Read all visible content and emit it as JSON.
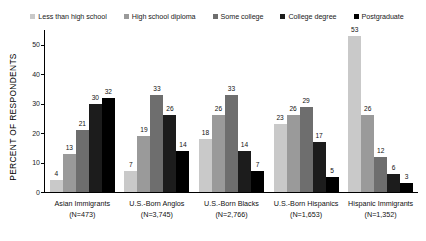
{
  "chart_data": {
    "type": "bar",
    "title": "",
    "subtitle": "",
    "xlabel": "",
    "ylabel": "PERCENT OF RESPONDENTS",
    "ylim": [
      0,
      55
    ],
    "yticks": [
      0,
      10,
      20,
      30,
      40,
      50
    ],
    "ytick_labels": [
      "0",
      "10",
      "20",
      "30",
      "40",
      "50"
    ],
    "grid": false,
    "legend_position": "top",
    "categories": [
      "Asian Immigrants",
      "U.S.-Born Anglos",
      "U.S.-Born Blacks",
      "U.S.-Born Hispanics",
      "Hispanic Immigrants"
    ],
    "category_sublabels": [
      "(N=473)",
      "(N=3,745)",
      "(N=2,766)",
      "(N=1,653)",
      "(N=1,352)"
    ],
    "series": [
      {
        "name": "Less than high school",
        "color": "#c9c9c9",
        "values": [
          4,
          7,
          18,
          23,
          53
        ]
      },
      {
        "name": "High school diploma",
        "color": "#9a9a9a",
        "values": [
          13,
          19,
          26,
          26,
          26
        ]
      },
      {
        "name": "Some college",
        "color": "#6e6e6e",
        "values": [
          21,
          33,
          33,
          29,
          12
        ]
      },
      {
        "name": "College degree",
        "color": "#1c1c1c",
        "values": [
          30,
          26,
          14,
          17,
          6
        ]
      },
      {
        "name": "Postgraduate",
        "color": "#000000",
        "values": [
          32,
          14,
          7,
          5,
          3
        ]
      }
    ]
  }
}
